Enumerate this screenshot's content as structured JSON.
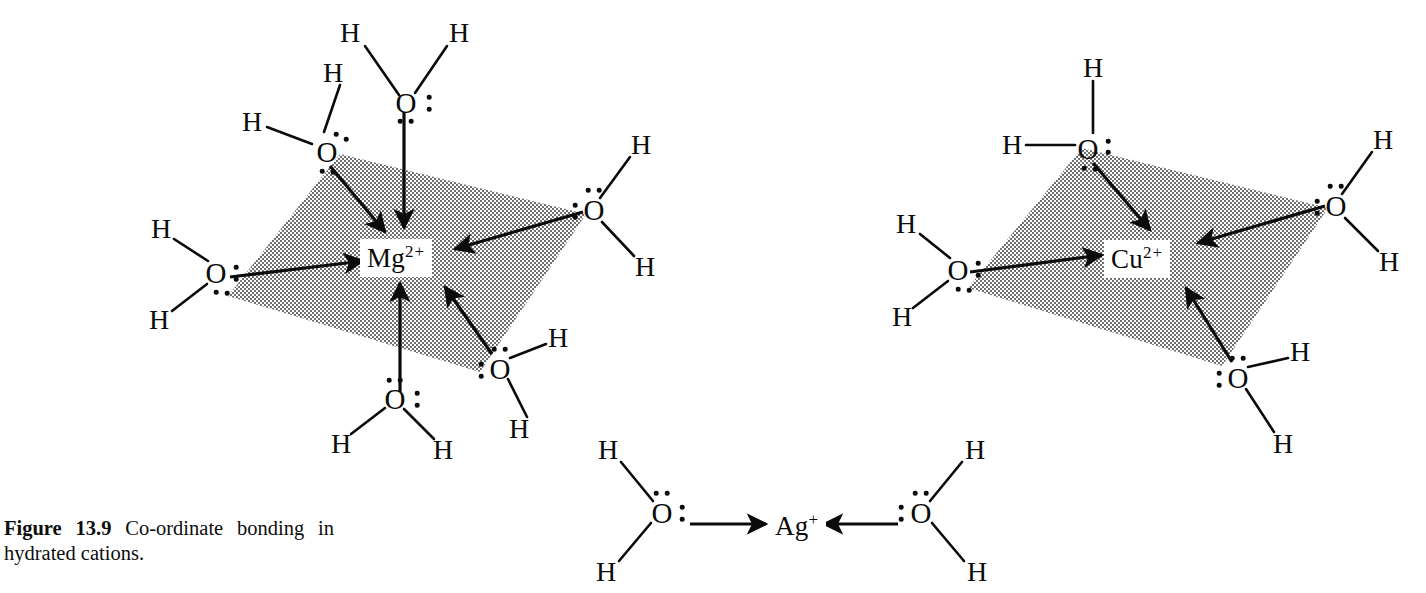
{
  "figure": {
    "label": "Figure",
    "number": "13.9",
    "caption_text": "Co-ordinate bonding in hydrated cations.",
    "caption_line1": "Co-ordinate  bonding  in  hy-",
    "caption_line2": "drated cations."
  },
  "colors": {
    "ink": "#0b0b0b",
    "plane_fill": "#a9a9a9",
    "page_background": "#ffffff",
    "label_background": "#ffffff"
  },
  "diagram": {
    "type": "lewis-structure-coordination-complex",
    "atom_labels": {
      "hydrogen": "H",
      "oxygen": "O"
    },
    "complexes": [
      {
        "id": "mg-complex",
        "ion_label": "Mg",
        "ion_charge": "2+",
        "ion_full": "Mg2+",
        "geometry": "octahedral",
        "coordination_number": 6,
        "ligand_count": 6,
        "ligand_formula": "H2O",
        "plane_shown": true,
        "equatorial_ligands": 4,
        "axial_ligands": 2,
        "ligands": [
          {
            "position": "axial-top",
            "lone_pairs": 2
          },
          {
            "position": "upper-left",
            "lone_pairs": 2
          },
          {
            "position": "left",
            "lone_pairs": 2
          },
          {
            "position": "right",
            "lone_pairs": 2
          },
          {
            "position": "lower-right",
            "lone_pairs": 2
          },
          {
            "position": "axial-bottom",
            "lone_pairs": 2
          }
        ]
      },
      {
        "id": "cu-complex",
        "ion_label": "Cu",
        "ion_charge": "2+",
        "ion_full": "Cu2+",
        "geometry": "square planar",
        "coordination_number": 4,
        "ligand_count": 4,
        "ligand_formula": "H2O",
        "plane_shown": true,
        "equatorial_ligands": 4,
        "axial_ligands": 0,
        "ligands": [
          {
            "position": "upper-left",
            "lone_pairs": 2
          },
          {
            "position": "left",
            "lone_pairs": 2
          },
          {
            "position": "right",
            "lone_pairs": 2
          },
          {
            "position": "lower-right",
            "lone_pairs": 2
          }
        ]
      },
      {
        "id": "ag-complex",
        "ion_label": "Ag",
        "ion_charge": "+",
        "ion_full": "Ag+",
        "geometry": "linear",
        "coordination_number": 2,
        "ligand_count": 2,
        "ligand_formula": "H2O",
        "plane_shown": false,
        "equatorial_ligands": 2,
        "axial_ligands": 0,
        "ligands": [
          {
            "position": "left",
            "lone_pairs": 2
          },
          {
            "position": "right",
            "lone_pairs": 2
          }
        ]
      }
    ]
  }
}
